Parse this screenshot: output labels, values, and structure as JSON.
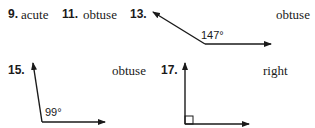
{
  "items": [
    {
      "number": "9.",
      "answer": "acute"
    },
    {
      "number": "11.",
      "answer": "obtuse"
    },
    {
      "number": "13.",
      "answer": "obtuse",
      "angle_label": "147°"
    },
    {
      "number": "15.",
      "answer": "obtuse",
      "angle_label": "99°"
    },
    {
      "number": "17.",
      "answer": "right"
    }
  ],
  "colors": {
    "text": "#1a1a1a",
    "line": "#1a1a1a"
  }
}
